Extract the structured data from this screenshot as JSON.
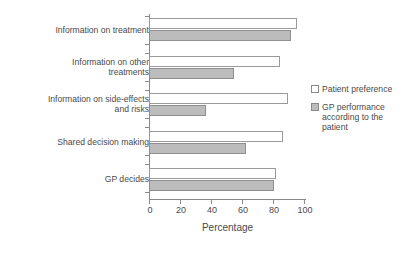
{
  "chart_data": {
    "type": "bar",
    "orientation": "horizontal",
    "title": "",
    "xlabel": "Percentage",
    "ylabel": "",
    "xlim": [
      0,
      100
    ],
    "xticks": [
      0,
      20,
      40,
      60,
      80,
      100
    ],
    "grid": false,
    "legend_position": "right",
    "categories": [
      "Information on treatment",
      "Information on other\ntreatments",
      "Information on side-effects\nand risks",
      "Shared decision making",
      "GP decides"
    ],
    "series": [
      {
        "name": "Patient preference",
        "color": "#ffffff",
        "values": [
          95,
          84,
          89,
          86,
          81
        ]
      },
      {
        "name": "GP performance according to the patient",
        "color": "#bcbcbc",
        "values": [
          91,
          54,
          36,
          62,
          80
        ]
      }
    ]
  },
  "legend": {
    "entries": [
      {
        "label": "Patient preference"
      },
      {
        "label": "GP performance according to the patient"
      }
    ]
  },
  "axis": {
    "x_title": "Percentage",
    "tick_labels": [
      "0",
      "20",
      "40",
      "60",
      "80",
      "100"
    ]
  }
}
